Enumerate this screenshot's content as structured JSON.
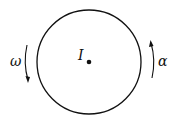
{
  "diagram": {
    "center_label": "I",
    "left_arrow_label": "ω",
    "right_arrow_label": "α",
    "left_arrow_direction": "down",
    "right_arrow_direction": "up"
  }
}
